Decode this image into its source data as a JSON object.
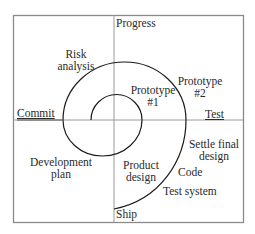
{
  "diagram": {
    "axes": {
      "top": "Progress",
      "left": "Commit",
      "right": "Test",
      "bottom": "Ship"
    },
    "labels": {
      "risk_analysis": [
        "Risk",
        "analysis"
      ],
      "prototype_1": [
        "Prototype",
        "#1"
      ],
      "prototype_2": [
        "Prototype",
        "#2"
      ],
      "development_plan": [
        "Development",
        "plan"
      ],
      "product_design": [
        "Product",
        "design"
      ],
      "settle_final_design": [
        "Settle final",
        "design"
      ],
      "code": "Code",
      "test_system": "Test system"
    },
    "colors": {
      "frame": "#8a8a8a",
      "axis": "#9a9a9a",
      "spiral": "#1a1a1a",
      "text": "#2a2a2a"
    }
  }
}
